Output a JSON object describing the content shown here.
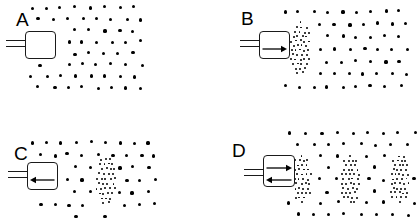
{
  "figure": {
    "width": 418,
    "height": 219,
    "background_color": "#ffffff",
    "ink_color": "#000000"
  },
  "panels": [
    {
      "id": "A",
      "label": "A",
      "label_pos": {
        "x": 16,
        "y": 10
      },
      "bounds": {
        "x": 0,
        "y": 0,
        "width": 209,
        "height": 110
      },
      "transducer": {
        "name": "transducer-a",
        "body": {
          "x": 25,
          "y": 31,
          "width": 31,
          "height": 28
        },
        "lead": {
          "x": 6,
          "y": 40,
          "width": 20,
          "gap": 6
        },
        "arrows": []
      },
      "field": {
        "name": "particle-field-a",
        "x": 30,
        "y": 6,
        "width": 102,
        "height": 80,
        "dot_class": "dot-coarse",
        "cols": 8,
        "rows": 8,
        "stagger": true
      },
      "dense_bands": []
    },
    {
      "id": "B",
      "label": "B",
      "label_pos": {
        "x": 241,
        "y": 9
      },
      "bounds": {
        "x": 209,
        "y": 0,
        "width": 209,
        "height": 110
      },
      "transducer": {
        "name": "transducer-b",
        "body": {
          "x": 259,
          "y": 31,
          "width": 31,
          "height": 28
        },
        "lead": {
          "x": 240,
          "y": 40,
          "width": 20,
          "gap": 6
        },
        "arrows": [
          {
            "direction": "right",
            "name": "arrow-right-icon",
            "y_offset": 14
          }
        ]
      },
      "field": {
        "name": "particle-field-b",
        "x": 283,
        "y": 10,
        "width": 115,
        "height": 75,
        "dot_class": "dot-coarse",
        "cols": 9,
        "rows": 7,
        "stagger": true
      },
      "dense_bands": [
        {
          "name": "dense-band-b-1",
          "x": 290,
          "y": 22,
          "width": 18,
          "height": 50
        }
      ]
    },
    {
      "id": "C",
      "label": "C",
      "label_pos": {
        "x": 14,
        "y": 144
      },
      "bounds": {
        "x": 0,
        "y": 110,
        "width": 209,
        "height": 109
      },
      "transducer": {
        "name": "transducer-c",
        "body": {
          "x": 27,
          "y": 162,
          "width": 31,
          "height": 28
        },
        "lead": {
          "x": 8,
          "y": 171,
          "width": 20,
          "gap": 6
        },
        "arrows": [
          {
            "direction": "left",
            "name": "arrow-left-icon",
            "y_offset": 14
          }
        ]
      },
      "field": {
        "name": "particle-field-c",
        "x": 31,
        "y": 141,
        "width": 115,
        "height": 74,
        "dot_class": "dot-coarse",
        "cols": 9,
        "rows": 7,
        "stagger": true
      },
      "dense_bands": [
        {
          "name": "dense-band-c-1",
          "x": 96,
          "y": 158,
          "width": 18,
          "height": 44
        }
      ]
    },
    {
      "id": "D",
      "label": "D",
      "label_pos": {
        "x": 232,
        "y": 141
      },
      "bounds": {
        "x": 209,
        "y": 110,
        "width": 209,
        "height": 109
      },
      "transducer": {
        "name": "transducer-d",
        "body": {
          "x": 263,
          "y": 155,
          "width": 32,
          "height": 32
        },
        "lead": {
          "x": 244,
          "y": 169,
          "width": 20,
          "gap": 6
        },
        "arrows": [
          {
            "direction": "right",
            "name": "arrow-right-icon",
            "y_offset": 9
          },
          {
            "direction": "left",
            "name": "arrow-left-icon",
            "y_offset": 21
          }
        ]
      },
      "field": {
        "name": "particle-field-d",
        "x": 288,
        "y": 131,
        "width": 125,
        "height": 82,
        "dot_class": "dot-coarse",
        "cols": 9,
        "rows": 8,
        "stagger": true
      },
      "dense_bands": [
        {
          "name": "dense-band-d-1",
          "x": 292,
          "y": 155,
          "width": 17,
          "height": 46
        },
        {
          "name": "dense-band-d-2",
          "x": 341,
          "y": 155,
          "width": 17,
          "height": 46
        },
        {
          "name": "dense-band-d-3",
          "x": 390,
          "y": 155,
          "width": 17,
          "height": 46
        }
      ]
    }
  ]
}
